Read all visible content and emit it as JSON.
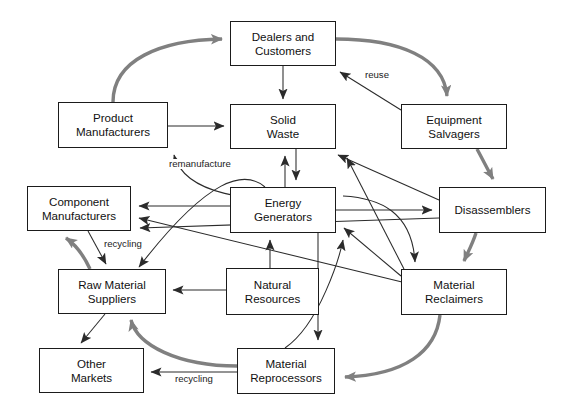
{
  "diagram": {
    "width": 565,
    "height": 418,
    "colors": {
      "box_border": "#1b1b1b",
      "box_fill": "#ffffff",
      "thin_arrow": "#2b2b2b",
      "thick_arrow": "#808080",
      "text": "#111111",
      "background": "#ffffff"
    },
    "nodes": [
      {
        "id": "dealers",
        "label": "Dealers and\nCustomers",
        "x": 230,
        "y": 21,
        "w": 106,
        "h": 45
      },
      {
        "id": "product_mfg",
        "label": "Product\nManufacturers",
        "x": 58,
        "y": 102,
        "w": 110,
        "h": 46
      },
      {
        "id": "solid_waste",
        "label": "Solid\nWaste",
        "x": 230,
        "y": 104,
        "w": 106,
        "h": 45
      },
      {
        "id": "equip_salv",
        "label": "Equipment\nSalvagers",
        "x": 401,
        "y": 104,
        "w": 106,
        "h": 45
      },
      {
        "id": "component_mfg",
        "label": "Component\nManufacturers",
        "x": 27,
        "y": 186,
        "w": 104,
        "h": 45
      },
      {
        "id": "energy_gen",
        "label": "Energy\nGenerators",
        "x": 230,
        "y": 187,
        "w": 106,
        "h": 46
      },
      {
        "id": "disassemblers",
        "label": "Disassemblers",
        "x": 439,
        "y": 187,
        "w": 107,
        "h": 46
      },
      {
        "id": "raw_material",
        "label": "Raw Material\nSuppliers",
        "x": 58,
        "y": 269,
        "w": 108,
        "h": 45
      },
      {
        "id": "natural_res",
        "label": "Natural\nResources",
        "x": 226,
        "y": 268,
        "w": 93,
        "h": 47
      },
      {
        "id": "mat_reclaim",
        "label": "Material\nReclaimers",
        "x": 401,
        "y": 269,
        "w": 106,
        "h": 46
      },
      {
        "id": "other_markets",
        "label": "Other\nMarkets",
        "x": 39,
        "y": 348,
        "w": 105,
        "h": 45
      },
      {
        "id": "mat_reproc",
        "label": "Material\nReprocessors",
        "x": 237,
        "y": 348,
        "w": 98,
        "h": 46
      }
    ],
    "edge_labels": [
      {
        "id": "reuse",
        "text": "reuse",
        "x": 364,
        "y": 70
      },
      {
        "id": "remanufacture",
        "text": "remanufacture",
        "x": 168,
        "y": 159
      },
      {
        "id": "recycling_upper",
        "text": "recycling",
        "x": 103,
        "y": 239
      },
      {
        "id": "recycling_lower",
        "text": "recycling",
        "x": 174,
        "y": 374
      }
    ],
    "edges": [
      {
        "from": "product_mfg",
        "to": "dealers",
        "style": "thick"
      },
      {
        "from": "dealers",
        "to": "equip_salv",
        "style": "thick"
      },
      {
        "from": "equip_salv",
        "to": "disassemblers",
        "style": "thick"
      },
      {
        "from": "disassemblers",
        "to": "mat_reclaim",
        "style": "thick"
      },
      {
        "from": "mat_reclaim",
        "to": "mat_reproc",
        "style": "thick"
      },
      {
        "from": "mat_reproc",
        "to": "raw_material",
        "style": "thick"
      },
      {
        "from": "raw_material",
        "to": "component_mfg",
        "style": "thick"
      },
      {
        "from": "dealers",
        "to": "solid_waste",
        "style": "thin"
      },
      {
        "from": "product_mfg",
        "to": "solid_waste",
        "style": "thin"
      },
      {
        "from": "equip_salv",
        "to": "dealers",
        "style": "thin",
        "label": "reuse"
      },
      {
        "from": "energy_gen",
        "to": "product_mfg",
        "style": "thin",
        "label": "remanufacture"
      },
      {
        "from": "energy_gen",
        "to": "solid_waste",
        "style": "thin"
      },
      {
        "from": "energy_gen",
        "to": "component_mfg",
        "style": "thin"
      },
      {
        "from": "energy_gen",
        "to": "disassemblers",
        "style": "thin"
      },
      {
        "from": "energy_gen",
        "to": "raw_material",
        "style": "thin"
      },
      {
        "from": "energy_gen",
        "to": "mat_reclaim",
        "style": "thin"
      },
      {
        "from": "energy_gen",
        "to": "mat_reproc",
        "style": "thin"
      },
      {
        "from": "solid_waste",
        "to": "energy_gen",
        "style": "thin"
      },
      {
        "from": "natural_res",
        "to": "energy_gen",
        "style": "thin"
      },
      {
        "from": "natural_res",
        "to": "raw_material",
        "style": "thin"
      },
      {
        "from": "component_mfg",
        "to": "raw_material",
        "style": "thin",
        "label": "recycling_upper"
      },
      {
        "from": "raw_material",
        "to": "other_markets",
        "style": "thin"
      },
      {
        "from": "mat_reproc",
        "to": "other_markets",
        "style": "thin",
        "label": "recycling_lower"
      },
      {
        "from": "mat_reproc",
        "to": "energy_gen",
        "style": "thin"
      },
      {
        "from": "mat_reclaim",
        "to": "energy_gen",
        "style": "thin"
      },
      {
        "from": "mat_reclaim",
        "to": "solid_waste",
        "style": "thin"
      },
      {
        "from": "disassemblers",
        "to": "solid_waste",
        "style": "thin"
      },
      {
        "from": "mat_reclaim",
        "to": "component_mfg",
        "style": "thin"
      },
      {
        "from": "disassemblers",
        "to": "component_mfg",
        "style": "thin"
      }
    ]
  }
}
